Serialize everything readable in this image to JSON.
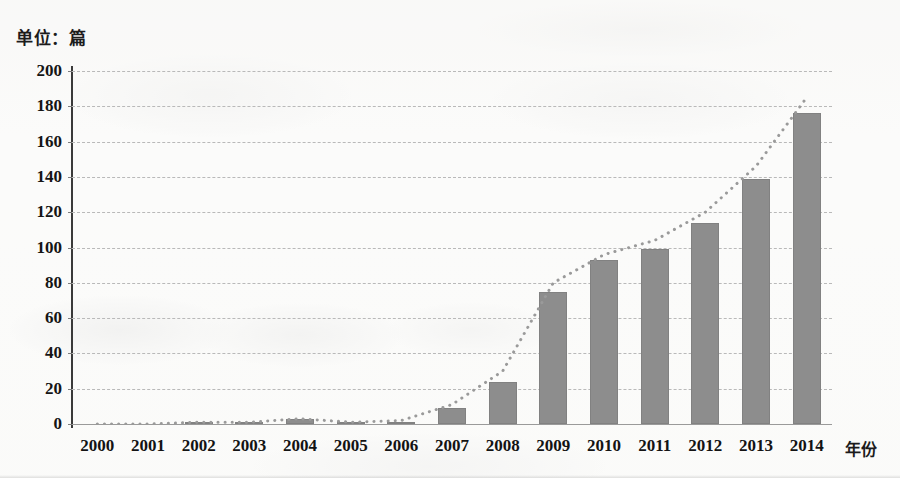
{
  "unit_title": "单位：篇",
  "x_axis_title": "年份",
  "chart_data": {
    "type": "bar",
    "title": "单位：篇",
    "xlabel": "年份",
    "ylabel": "单位：篇",
    "ylim": [
      0,
      200
    ],
    "y_ticks": [
      0,
      20,
      40,
      60,
      80,
      100,
      120,
      140,
      160,
      180,
      200
    ],
    "grid": true,
    "legend": "none",
    "categories": [
      "2000",
      "2001",
      "2002",
      "2003",
      "2004",
      "2005",
      "2006",
      "2007",
      "2008",
      "2009",
      "2010",
      "2011",
      "2012",
      "2013",
      "2014"
    ],
    "values": [
      0,
      0,
      1,
      1,
      3,
      1,
      1,
      9,
      24,
      75,
      93,
      99,
      114,
      139,
      176
    ],
    "series": [
      {
        "name": "发文量",
        "type": "bar",
        "values": [
          0,
          0,
          1,
          1,
          3,
          1,
          1,
          9,
          24,
          75,
          93,
          99,
          114,
          139,
          176
        ]
      },
      {
        "name": "趋势线",
        "type": "line",
        "style": "dotted",
        "values": [
          0,
          0,
          1,
          1,
          3,
          1,
          2,
          11,
          30,
          80,
          96,
          104,
          120,
          146,
          185
        ]
      }
    ],
    "colors": {
      "bar": "#8d8d8d",
      "gridline": "#b9b9b9",
      "axis": "#3a3a3a",
      "trendline": "#9a9a9a",
      "text": "#131313"
    }
  }
}
